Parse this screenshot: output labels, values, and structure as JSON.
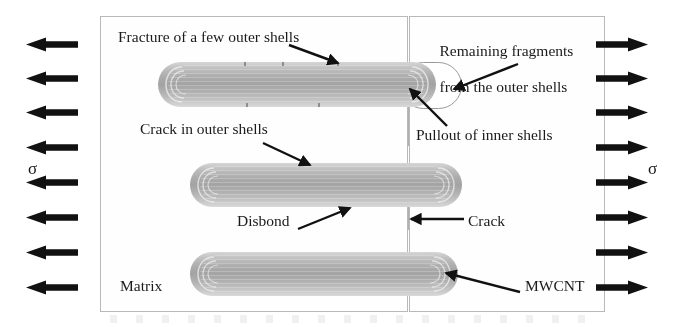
{
  "figure": {
    "background_color": "#ffffff",
    "nanotube_color": "#ababab",
    "matrix_border_color": "#b9b9b9",
    "arrow_color": "#111111"
  },
  "stress": {
    "symbol": "σ",
    "left_symbol": "σ",
    "right_symbol": "σ",
    "left_arrow_count": 8,
    "right_arrow_count": 8,
    "left_direction": "left",
    "right_direction": "right"
  },
  "matrix": {
    "label": "Matrix",
    "panels": [
      {
        "name": "left-panel"
      },
      {
        "name": "right-panel"
      }
    ],
    "crack_label": "Crack"
  },
  "labels": {
    "fracture_outer_shells": "Fracture of a few outer shells",
    "remaining_fragments_line1": "Remaining fragments",
    "remaining_fragments_line2": "from the outer shells",
    "pullout_inner_shells": "Pullout of inner shells",
    "crack_in_outer_shells": "Crack in outer shells",
    "disbond": "Disbond",
    "crack": "Crack",
    "matrix": "Matrix",
    "mwcnt": "MWCNT"
  },
  "nanotubes": [
    {
      "id": "top",
      "name": "fractured-nanotube",
      "state": "fractured outer shells with inner shells pulled out",
      "annotations": [
        "Fracture of a few outer shells",
        "Remaining fragments from the outer shells",
        "Pullout of inner shells"
      ]
    },
    {
      "id": "middle",
      "name": "cracked-nanotube",
      "state": "crack in outer shells, disbonded from matrix",
      "annotations": [
        "Crack in outer shells",
        "Disbond"
      ]
    },
    {
      "id": "bottom",
      "name": "intact-nanotube",
      "state": "intact",
      "annotations": [
        "MWCNT"
      ]
    }
  ]
}
